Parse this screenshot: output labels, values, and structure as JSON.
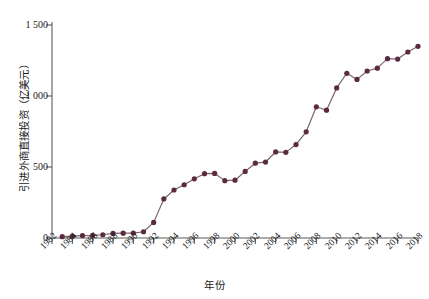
{
  "chart_data": {
    "type": "line",
    "title": "",
    "xlabel": "年份",
    "ylabel": "引进外商直接投资（亿美元）",
    "xlim": [
      1982,
      2018
    ],
    "ylim": [
      0,
      1500
    ],
    "grid": false,
    "legend": "none",
    "series_color": "#5c2a3e",
    "line_color": "#7a6472",
    "marker": "circle",
    "x_tick_labels": [
      "1982",
      "1984",
      "1986",
      "1988",
      "1990",
      "1992",
      "1994",
      "1996",
      "1998",
      "2000",
      "2002",
      "2004",
      "2006",
      "2008",
      "2010",
      "2012",
      "2014",
      "2016",
      "2018"
    ],
    "y_tick_labels": [
      "0",
      "500",
      "1 000",
      "1 500"
    ],
    "y_tick_values": [
      0,
      500,
      1000,
      1500
    ],
    "x": [
      1983,
      1984,
      1985,
      1986,
      1987,
      1988,
      1989,
      1990,
      1991,
      1992,
      1993,
      1994,
      1995,
      1996,
      1997,
      1998,
      1999,
      2000,
      2001,
      2002,
      2003,
      2004,
      2005,
      2006,
      2007,
      2008,
      2009,
      2010,
      2011,
      2012,
      2013,
      2014,
      2015,
      2016,
      2017,
      2018
    ],
    "values": [
      9,
      13,
      17,
      19,
      23,
      32,
      34,
      35,
      44,
      110,
      275,
      338,
      375,
      417,
      453,
      455,
      404,
      407,
      469,
      527,
      535,
      606,
      603,
      658,
      748,
      924,
      900,
      1057,
      1160,
      1117,
      1176,
      1196,
      1263,
      1260,
      1310,
      1350
    ],
    "series": [
      {
        "name": "引进外商直接投资",
        "values": [
          9,
          13,
          17,
          19,
          23,
          32,
          34,
          35,
          44,
          110,
          275,
          338,
          375,
          417,
          453,
          455,
          404,
          407,
          469,
          527,
          535,
          606,
          603,
          658,
          748,
          924,
          900,
          1057,
          1160,
          1117,
          1176,
          1196,
          1263,
          1260,
          1310,
          1350
        ]
      }
    ]
  },
  "axes": {
    "y_title": "引进外商直接投资（亿美元）",
    "x_title": "年份"
  }
}
